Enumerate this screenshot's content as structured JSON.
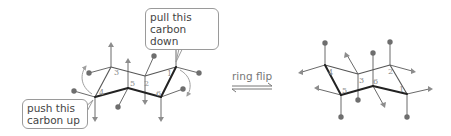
{
  "callouts": {
    "pull": "pull this\ncarbon down",
    "push": "push this\ncarbon up"
  },
  "arrow": {
    "label": "ring flip"
  },
  "left_chair": {
    "carbons": [
      {
        "n": "1",
        "x": 176,
        "y": 67
      },
      {
        "n": "2",
        "x": 145,
        "y": 76
      },
      {
        "n": "3",
        "x": 111,
        "y": 67
      },
      {
        "n": "4",
        "x": 95,
        "y": 97
      },
      {
        "n": "5",
        "x": 128,
        "y": 88
      },
      {
        "n": "6",
        "x": 161,
        "y": 97
      }
    ]
  },
  "right_chair": {
    "carbons": [
      {
        "n": "1",
        "x": 407,
        "y": 94
      },
      {
        "n": "2",
        "x": 390,
        "y": 65
      },
      {
        "n": "3",
        "x": 358,
        "y": 74
      },
      {
        "n": "4",
        "x": 325,
        "y": 65
      },
      {
        "n": "5",
        "x": 341,
        "y": 95
      },
      {
        "n": "6",
        "x": 373,
        "y": 86
      }
    ]
  },
  "legend": {
    "circle": "substituent (circle)",
    "triangle": "substituent (triangle)"
  },
  "colors": {
    "bond": "#555555",
    "bond_front": "#222222",
    "circle": "#6e6e6e",
    "triangle": "#8c8c8c",
    "curved_arrow": "#a0a0a0"
  }
}
